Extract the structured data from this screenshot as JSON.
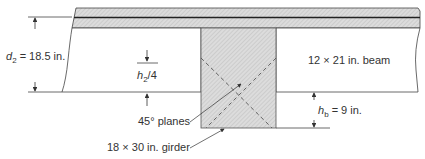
{
  "labels": {
    "d2_symbol": "d",
    "d2_sub": "2",
    "d2_value": " = 18.5 in.",
    "h2_symbol": "h",
    "h2_sub": "2",
    "h2_tail": "/4",
    "beam": "12 × 21 in. beam",
    "planes": "45° planes",
    "girder": "18 × 30 in. girder",
    "hb_symbol": "h",
    "hb_sub": "b",
    "hb_value": " = 9 in."
  },
  "colors": {
    "hatch_fill": "#d8d8d8",
    "line": "#333333"
  }
}
